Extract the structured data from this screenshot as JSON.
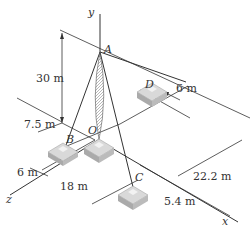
{
  "figure": {
    "axes": {
      "x": "x",
      "y": "y",
      "z": "z"
    },
    "points": {
      "A": "A",
      "B": "B",
      "C": "C",
      "D": "D",
      "O": "O"
    },
    "dimensions": {
      "height": "30 m",
      "b_offset": "7.5 m",
      "b_z": "6 m",
      "c_x": "18 m",
      "c_z": "5.4 m",
      "d_x": "22.2 m",
      "d_z": "6 m"
    }
  }
}
